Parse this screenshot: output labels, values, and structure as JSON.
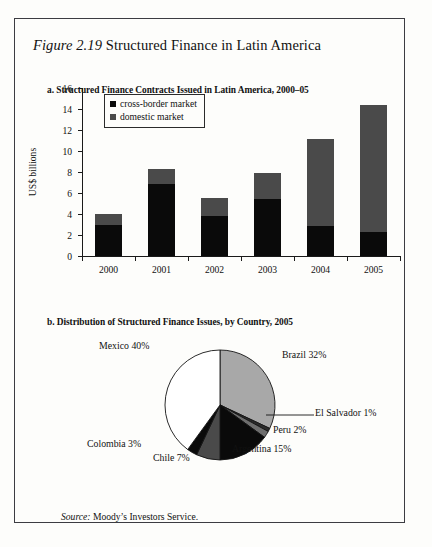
{
  "figure": {
    "number_label": "Figure 2.19",
    "title": "Structured Finance in Latin America"
  },
  "panel_a": {
    "title": "a. Structured Finance Contracts Issued in Latin America, 2000–05"
  },
  "panel_b": {
    "title": "b. Distribution of Structured Finance Issues, by Country, 2005"
  },
  "source": {
    "label": "Source:",
    "text": "Moody’s Investors Service."
  },
  "colors": {
    "cross_border": "#0a0a0a",
    "domestic": "#4a4a4a",
    "mexico": "#ffffff",
    "brazil": "#a8a8a8",
    "argentina": "#0a0a0a",
    "chile": "#4a4a4a",
    "colombia": "#0a0a0a",
    "peru": "#6e6e6e",
    "el_salvador": "#2a2a2a",
    "frame": "#3c3c42"
  },
  "chart_data": [
    {
      "type": "bar",
      "stacked": true,
      "title": "a. Structured Finance Contracts Issued in Latin America, 2000–05",
      "xlabel": "",
      "ylabel": "US$ billions",
      "categories": [
        "2000",
        "2001",
        "2002",
        "2003",
        "2004",
        "2005"
      ],
      "ylim": [
        0,
        16
      ],
      "yticks": [
        0,
        2,
        4,
        6,
        8,
        10,
        12,
        14,
        16
      ],
      "ytick_labels": [
        "0",
        "2",
        "4",
        "6",
        "8",
        "10",
        "12",
        "14",
        "16"
      ],
      "grid": false,
      "legend_position": "top-left",
      "series": [
        {
          "name": "cross-border market",
          "color": "#0a0a0a",
          "values": [
            3.0,
            6.9,
            3.8,
            5.4,
            2.9,
            2.3
          ]
        },
        {
          "name": "domestic market",
          "color": "#4a4a4a",
          "values": [
            1.0,
            1.4,
            1.7,
            2.5,
            8.2,
            12.1
          ]
        }
      ],
      "totals": [
        4.0,
        8.3,
        5.5,
        7.9,
        11.1,
        14.4
      ]
    },
    {
      "type": "pie",
      "title": "b. Distribution of Structured Finance Issues, by Country, 2005",
      "unit": "%",
      "slices": [
        {
          "label": "Brazil 32%",
          "name": "Brazil",
          "value": 32,
          "color": "#a8a8a8"
        },
        {
          "label": "El Salvador 1%",
          "name": "El Salvador",
          "value": 1,
          "color": "#2a2a2a"
        },
        {
          "label": "Peru 2%",
          "name": "Peru",
          "value": 2,
          "color": "#6e6e6e"
        },
        {
          "label": "Argentina 15%",
          "name": "Argentina",
          "value": 15,
          "color": "#0a0a0a"
        },
        {
          "label": "Chile 7%",
          "name": "Chile",
          "value": 7,
          "color": "#4a4a4a"
        },
        {
          "label": "Colombia 3%",
          "name": "Colombia",
          "value": 3,
          "color": "#0a0a0a"
        },
        {
          "label": "Mexico 40%",
          "name": "Mexico",
          "value": 40,
          "color": "#ffffff"
        }
      ]
    }
  ]
}
